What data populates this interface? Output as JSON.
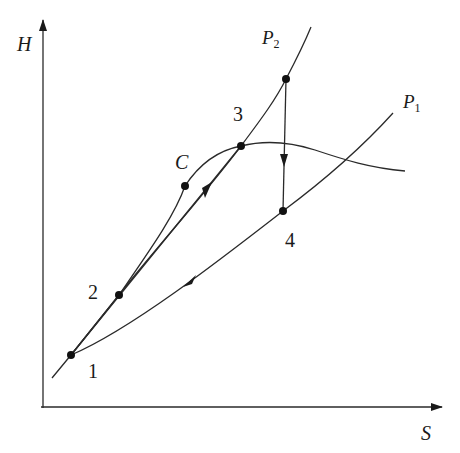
{
  "diagram": {
    "type": "H-S (enthalpy-entropy) thermodynamic cycle diagram",
    "axes": {
      "y_label": "H",
      "x_label": "S"
    },
    "curves": {
      "isobar_high": {
        "label_main": "P",
        "label_sub": "2"
      },
      "isobar_low": {
        "label_main": "P",
        "label_sub": "1"
      },
      "saturation_curve": {
        "critical_point_label": "C"
      }
    },
    "points": [
      {
        "id": "1",
        "label": "1"
      },
      {
        "id": "2",
        "label": "2"
      },
      {
        "id": "3",
        "label": "3"
      },
      {
        "id": "4",
        "label": "4"
      },
      {
        "id": "C",
        "label": "C"
      }
    ],
    "processes": [
      {
        "from": "1",
        "to": "3",
        "direction": "up"
      },
      {
        "from": "top",
        "to": "4",
        "direction": "down"
      },
      {
        "from": "4",
        "to": "1",
        "direction": "down-left"
      }
    ],
    "colors": {
      "line": "#2a2a2a",
      "background": "#ffffff"
    }
  }
}
